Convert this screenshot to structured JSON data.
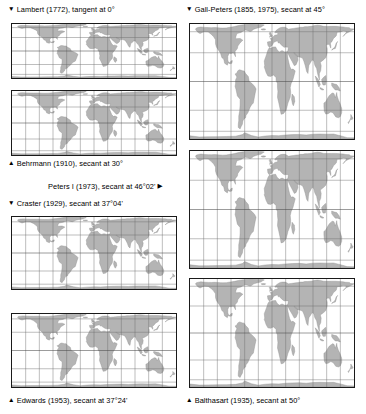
{
  "figure": {
    "title_text": "",
    "background_color": "#ffffff",
    "land_color": "#b4b4b4",
    "graticule_color": "#6e6e6e",
    "border_color": "#1a1a1a"
  },
  "markers": {
    "down": "▼",
    "up": "▲",
    "right": "▶"
  },
  "panels": [
    {
      "id": "lambert",
      "caption": "Lambert (1772), tangent at 0°",
      "marker": "▼",
      "marker_position": "before",
      "caption_position": "above",
      "projection": "cylindrical-equal-area",
      "standard_parallel": "0°",
      "author": "Lambert",
      "year": "1772",
      "fit": "tangent",
      "column": "left"
    },
    {
      "id": "behrmann",
      "caption": "Behrmann (1910), secant at 30°",
      "marker": "▲",
      "marker_position": "before",
      "caption_position": "below",
      "projection": "cylindrical-equal-area",
      "standard_parallel": "30°",
      "author": "Behrmann",
      "year": "1910",
      "fit": "secant",
      "column": "left"
    },
    {
      "id": "craster",
      "caption": "Craster (1929), secant at 37°04'",
      "marker": "▼",
      "marker_position": "before",
      "caption_position": "above",
      "projection": "cylindrical-equal-area",
      "standard_parallel": "37°04'",
      "author": "Craster",
      "year": "1929",
      "fit": "secant",
      "column": "left"
    },
    {
      "id": "edwards",
      "caption": "Edwards (1953), secant at 37°24'",
      "marker": "▲",
      "marker_position": "before",
      "caption_position": "below",
      "projection": "cylindrical-equal-area",
      "standard_parallel": "37°24'",
      "author": "Edwards",
      "year": "1953",
      "fit": "secant",
      "column": "left"
    },
    {
      "id": "gall-peters",
      "caption": "Gall-Peters (1855, 1975), secant at 45°",
      "marker": "▼",
      "marker_position": "before",
      "caption_position": "above",
      "projection": "cylindrical-equal-area",
      "standard_parallel": "45°",
      "author": "Gall-Peters",
      "year": "1855, 1975",
      "fit": "secant",
      "column": "right"
    },
    {
      "id": "peters-i",
      "caption": "Peters I (1973), secant at 46°02'",
      "marker": "▶",
      "marker_position": "after",
      "caption_position": "left",
      "projection": "cylindrical-equal-area",
      "standard_parallel": "46°02'",
      "author": "Peters I",
      "year": "1973",
      "fit": "secant",
      "column": "right"
    },
    {
      "id": "balthasart",
      "caption": "Balthasart (1935), secant at 50°",
      "marker": "▲",
      "marker_position": "before",
      "caption_position": "below",
      "projection": "cylindrical-equal-area",
      "standard_parallel": "50°",
      "author": "Balthasart",
      "year": "1935",
      "fit": "secant",
      "column": "right"
    }
  ],
  "graticule": {
    "meridian_interval_deg": 30,
    "parallel_interval_deg": 30,
    "meridian_count": 11,
    "parallel_count": 5,
    "lon_range": [
      -180,
      180
    ],
    "lat_range": [
      -90,
      90
    ]
  }
}
